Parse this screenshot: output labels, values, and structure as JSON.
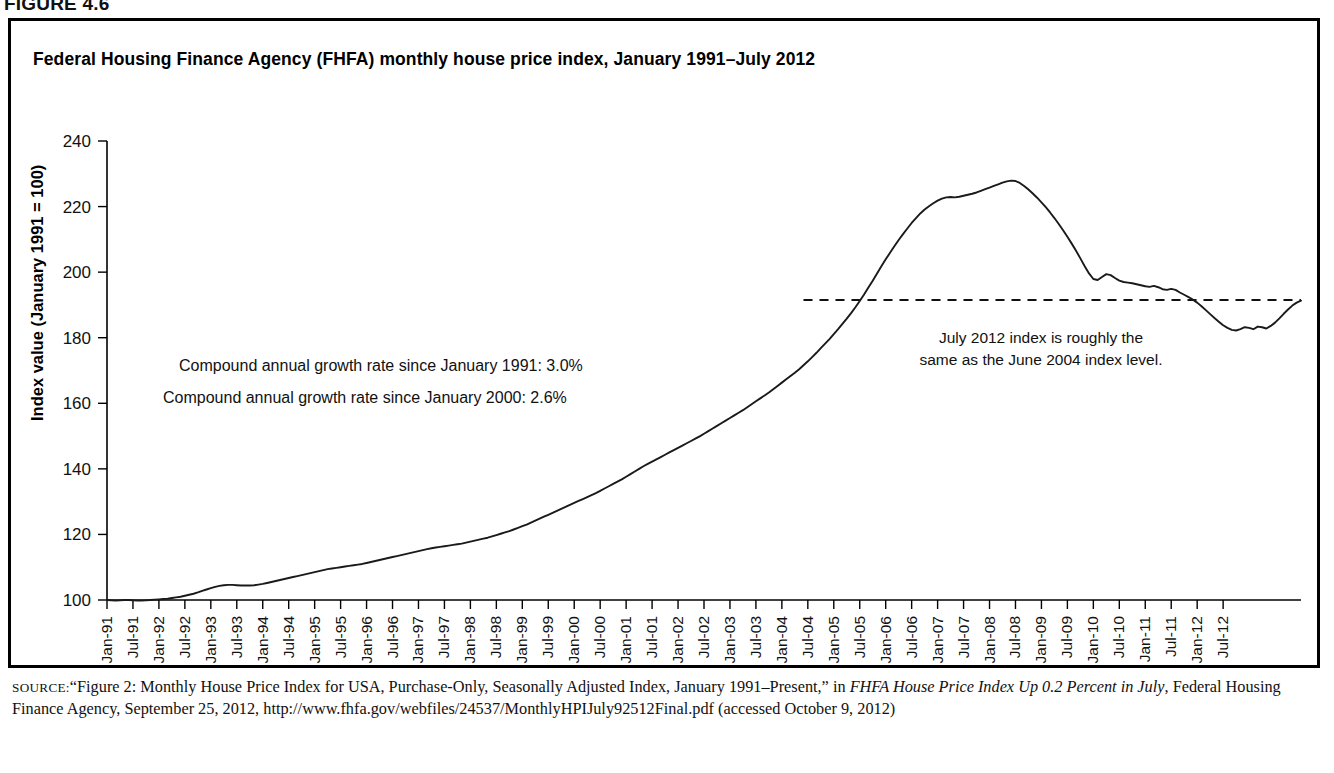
{
  "figure": {
    "number_label": "FIGURE 4.6",
    "title": "Federal Housing Finance Agency (FHFA) monthly house price index, January 1991–July 2012"
  },
  "annotations": {
    "cagr_1991": "Compound annual growth rate since January 1991: 3.0%",
    "cagr_2000": "Compound annual growth rate since January 2000: 2.6%",
    "reference_note_line1": "July 2012 index is roughly the",
    "reference_note_line2": "same as the June 2004 index level."
  },
  "source": {
    "label": "SOURCE:",
    "text_part1": "“Figure 2: Monthly House Price Index for USA, Purchase-Only, Seasonally Adjusted Index, January 1991–Present,” in ",
    "italic_title": "FHFA House Price Index Up 0.2 Percent in July",
    "text_part2": ", Federal Housing Finance Agency, September 25, 2012, http://www.fhfa.gov/webfiles/24537/MonthlyHPIJuly92512Final.pdf (accessed October 9, 2012)"
  },
  "chart_data": {
    "type": "line",
    "title": "Federal Housing Finance Agency (FHFA) monthly house price index, January 1991–July 2012",
    "xlabel": "",
    "ylabel": "Index value (January 1991 = 100)",
    "ylim": [
      100,
      240
    ],
    "yticks": [
      100,
      120,
      140,
      160,
      180,
      200,
      220,
      240
    ],
    "grid": false,
    "legend": "none",
    "x_tick_labels": [
      "Jan-91",
      "Jul-91",
      "Jan-92",
      "Jul-92",
      "Jan-93",
      "Jul-93",
      "Jan-94",
      "Jul-94",
      "Jan-95",
      "Jul-95",
      "Jan-96",
      "Jul-96",
      "Jan-97",
      "Jul-97",
      "Jan-98",
      "Jul-98",
      "Jan-99",
      "Jul-99",
      "Jan-00",
      "Jul-00",
      "Jan-01",
      "Jul-01",
      "Jan-02",
      "Jul-02",
      "Jan-03",
      "Jul-03",
      "Jan-04",
      "Jul-04",
      "Jan-05",
      "Jul-05",
      "Jan-06",
      "Jul-06",
      "Jan-07",
      "Jul-07",
      "Jan-08",
      "Jul-08",
      "Jan-09",
      "Jul-09",
      "Jan-10",
      "Jul-10",
      "Jan-11",
      "Jul-11",
      "Jan-12",
      "Jul-12"
    ],
    "x_start": "Jan-91",
    "x_end": "Jul-12",
    "n_points": 259,
    "reference_line": {
      "value": 191.5,
      "style": "dashed",
      "x_from": "Jun-04",
      "x_to": "Jul-12",
      "note": "July 2012 index is roughly the same as the June 2004 index level."
    },
    "series": [
      {
        "name": "FHFA monthly house price index (purchase-only, seasonally adjusted)",
        "values": [
          100.0,
          99.9,
          99.8,
          99.9,
          100.0,
          100.0,
          99.9,
          99.8,
          99.8,
          99.9,
          100.0,
          100.1,
          100.2,
          100.3,
          100.4,
          100.6,
          100.8,
          101.0,
          101.3,
          101.6,
          101.9,
          102.3,
          102.8,
          103.2,
          103.6,
          104.0,
          104.3,
          104.5,
          104.6,
          104.6,
          104.5,
          104.4,
          104.4,
          104.4,
          104.5,
          104.7,
          104.9,
          105.2,
          105.5,
          105.8,
          106.1,
          106.4,
          106.7,
          107.0,
          107.3,
          107.6,
          107.9,
          108.2,
          108.5,
          108.8,
          109.1,
          109.4,
          109.6,
          109.8,
          110.0,
          110.2,
          110.4,
          110.6,
          110.8,
          111.0,
          111.3,
          111.6,
          111.9,
          112.2,
          112.5,
          112.8,
          113.1,
          113.4,
          113.7,
          114.0,
          114.3,
          114.6,
          114.9,
          115.2,
          115.5,
          115.8,
          116.0,
          116.2,
          116.4,
          116.6,
          116.8,
          117.0,
          117.2,
          117.5,
          117.8,
          118.1,
          118.4,
          118.7,
          119.0,
          119.4,
          119.8,
          120.2,
          120.6,
          121.0,
          121.5,
          122.0,
          122.5,
          123.0,
          123.6,
          124.2,
          124.8,
          125.4,
          126.0,
          126.6,
          127.2,
          127.8,
          128.4,
          129.0,
          129.6,
          130.2,
          130.8,
          131.4,
          132.0,
          132.6,
          133.3,
          134.0,
          134.7,
          135.4,
          136.1,
          136.8,
          137.6,
          138.4,
          139.2,
          140.0,
          140.8,
          141.5,
          142.2,
          142.9,
          143.6,
          144.3,
          145.0,
          145.7,
          146.4,
          147.1,
          147.8,
          148.5,
          149.2,
          149.9,
          150.7,
          151.5,
          152.3,
          153.1,
          153.9,
          154.7,
          155.5,
          156.3,
          157.1,
          157.9,
          158.8,
          159.7,
          160.6,
          161.5,
          162.4,
          163.3,
          164.3,
          165.3,
          166.3,
          167.3,
          168.3,
          169.3,
          170.4,
          171.6,
          172.8,
          174.1,
          175.4,
          176.8,
          178.2,
          179.6,
          181.1,
          182.6,
          184.2,
          185.8,
          187.5,
          189.3,
          191.2,
          193.2,
          195.3,
          197.4,
          199.6,
          201.8,
          203.9,
          205.9,
          207.9,
          209.8,
          211.6,
          213.3,
          215.0,
          216.5,
          217.9,
          219.1,
          220.1,
          221.0,
          221.8,
          222.4,
          222.8,
          222.9,
          222.8,
          223.0,
          223.3,
          223.6,
          223.9,
          224.3,
          224.8,
          225.3,
          225.8,
          226.3,
          226.8,
          227.3,
          227.7,
          227.9,
          227.8,
          227.2,
          226.3,
          225.2,
          224.0,
          222.7,
          221.3,
          219.8,
          218.2,
          216.5,
          214.7,
          212.8,
          210.8,
          208.7,
          206.5,
          204.2,
          201.8,
          199.6,
          197.9,
          197.6,
          198.5,
          199.4,
          199.1,
          198.2,
          197.4,
          197.0,
          196.8,
          196.6,
          196.3,
          196.0,
          195.7,
          195.5,
          195.8,
          195.4,
          194.8,
          194.6,
          194.9,
          194.6,
          193.8,
          193.1,
          192.4,
          191.6,
          190.7,
          189.6,
          188.4,
          187.2,
          186.0,
          184.9,
          183.8,
          183.0,
          182.4,
          182.2,
          182.6,
          183.2,
          183.0,
          182.6,
          183.4,
          183.2,
          182.8,
          183.6,
          184.6,
          185.9,
          187.3,
          188.6,
          189.8,
          190.7,
          191.3
        ]
      }
    ],
    "peak": {
      "label": "peak",
      "value": 227.9,
      "approx_date": "Apr-07"
    },
    "trough": {
      "label": "trough",
      "value": 182.2,
      "approx_date": "Feb-11"
    },
    "end_value": 191.3
  }
}
